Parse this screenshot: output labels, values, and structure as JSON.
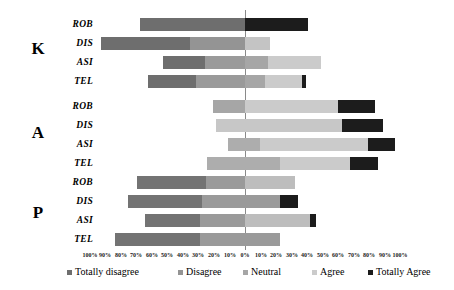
{
  "chart_data": {
    "type": "bar",
    "subtype": "diverging-stacked-likert",
    "title": "",
    "xlabel": "",
    "ylabel": "",
    "grid": false,
    "legend_position": "bottom",
    "axis": {
      "tick_labels": [
        "100%",
        "90%",
        "80%",
        "70%",
        "60%",
        "50%",
        "40%",
        "30%",
        "20%",
        "10%",
        "0%",
        "10%",
        "20%",
        "30%",
        "40%",
        "50%",
        "60%",
        "70%",
        "80%",
        "90%",
        "100%"
      ],
      "tick_values": [
        -100,
        -90,
        -80,
        -70,
        -60,
        -50,
        -40,
        -30,
        -20,
        -10,
        0,
        10,
        20,
        30,
        40,
        50,
        60,
        70,
        80,
        90,
        100
      ],
      "xlim": [
        -100,
        100
      ],
      "zero_at": 0
    },
    "legend": [
      {
        "label": "Totally disagree",
        "color": "#6e6e6e"
      },
      {
        "label": "Disagree",
        "color": "#8f8f8f"
      },
      {
        "label": "Neutral",
        "color": "#a8a8a8"
      },
      {
        "label": "Agree",
        "color": "#cfcfcf"
      },
      {
        "label": "Totally Agree",
        "color": "#1f1f1f"
      }
    ],
    "categories": [
      "Totally disagree",
      "Disagree",
      "Neutral",
      "Agree",
      "Totally Agree"
    ],
    "groups": [
      {
        "name": "K",
        "rows": [
          {
            "label": "ROB",
            "start": -68,
            "values": [
              0,
              0,
              68,
              0,
              41
            ]
          },
          {
            "label": "DIS",
            "start": -92,
            "values": [
              57,
              35,
              16,
              0,
              0
            ]
          },
          {
            "label": "ASI",
            "start": -53,
            "values": [
              27,
              26,
              34,
              0,
              0
            ]
          },
          {
            "label": "TEL",
            "start": -63,
            "values": [
              31,
              32,
              24,
              0,
              4
            ]
          }
        ]
      },
      {
        "name": "A",
        "rows": [
          {
            "label": "ROB",
            "start": -21,
            "values": [
              0,
              0,
              21,
              60,
              24
            ]
          },
          {
            "label": "DIS",
            "start": -19,
            "values": [
              0,
              0,
              0,
              81,
              26
            ]
          },
          {
            "label": "ASI",
            "start": -11,
            "values": [
              0,
              0,
              21,
              70,
              17
            ]
          },
          {
            "label": "TEL",
            "start": -24,
            "values": [
              0,
              0,
              47,
              45,
              18
            ]
          }
        ]
      },
      {
        "name": "P",
        "rows": [
          {
            "label": "ROB",
            "start": -70,
            "values": [
              45,
              25,
              32,
              0,
              0
            ]
          },
          {
            "label": "DIS",
            "start": -76,
            "values": [
              48,
              50,
              0,
              0,
              12
            ]
          },
          {
            "label": "ASI",
            "start": -65,
            "values": [
              35,
              29,
              42,
              0,
              4
            ]
          },
          {
            "label": "TEL",
            "start": -84,
            "values": [
              55,
              51,
              0,
              0,
              0
            ]
          }
        ]
      }
    ]
  },
  "geometry": {
    "zero_x": 245,
    "px_per_pct": 1.55,
    "group_letters": [
      {
        "name": "K",
        "x": 38,
        "y": 40
      },
      {
        "name": "A",
        "x": 38,
        "y": 124
      },
      {
        "name": "P",
        "x": 38,
        "y": 204
      }
    ],
    "rows": [
      {
        "group": "K",
        "label": "ROB",
        "y": 18,
        "segs": [
          {
            "cat": "Totally disagree",
            "x": 140,
            "w": 105,
            "color": "#6e6e6e"
          },
          {
            "cat": "Totally Agree",
            "x": 245,
            "w": 63,
            "color": "#1c1c1c"
          }
        ]
      },
      {
        "group": "K",
        "label": "DIS",
        "y": 37,
        "segs": [
          {
            "cat": "Totally disagree",
            "x": 101,
            "w": 89,
            "color": "#6e6e6e"
          },
          {
            "cat": "Disagree",
            "x": 190,
            "w": 55,
            "color": "#949494"
          },
          {
            "cat": "Neutral",
            "x": 245,
            "w": 25,
            "color": "#c4c4c4"
          }
        ]
      },
      {
        "group": "K",
        "label": "ASI",
        "y": 56,
        "segs": [
          {
            "cat": "Totally disagree",
            "x": 163,
            "w": 42,
            "color": "#6e6e6e"
          },
          {
            "cat": "Disagree",
            "x": 205,
            "w": 40,
            "color": "#9a9a9a"
          },
          {
            "cat": "Neutral",
            "x": 245,
            "w": 23,
            "color": "#a6a6a6"
          },
          {
            "cat": "Agree",
            "x": 268,
            "w": 53,
            "color": "#cbcbcb"
          }
        ]
      },
      {
        "group": "K",
        "label": "TEL",
        "y": 75,
        "segs": [
          {
            "cat": "Totally disagree",
            "x": 148,
            "w": 48,
            "color": "#6e6e6e"
          },
          {
            "cat": "Disagree",
            "x": 196,
            "w": 49,
            "color": "#9a9a9a"
          },
          {
            "cat": "Neutral",
            "x": 245,
            "w": 20,
            "color": "#a6a6a6"
          },
          {
            "cat": "Agree",
            "x": 265,
            "w": 37,
            "color": "#cbcbcb"
          },
          {
            "cat": "Totally Agree",
            "x": 302,
            "w": 4,
            "color": "#1c1c1c"
          }
        ]
      },
      {
        "group": "A",
        "label": "ROB",
        "y": 100,
        "segs": [
          {
            "cat": "Neutral",
            "x": 213,
            "w": 32,
            "color": "#a6a6a6"
          },
          {
            "cat": "Agree",
            "x": 245,
            "w": 93,
            "color": "#cbcbcb"
          },
          {
            "cat": "Totally Agree",
            "x": 338,
            "w": 37,
            "color": "#1c1c1c"
          }
        ]
      },
      {
        "group": "A",
        "label": "DIS",
        "y": 119,
        "segs": [
          {
            "cat": "Agree",
            "x": 216,
            "w": 126,
            "color": "#c7c7c7"
          },
          {
            "cat": "Totally Agree",
            "x": 342,
            "w": 41,
            "color": "#1c1c1c"
          }
        ]
      },
      {
        "group": "A",
        "label": "ASI",
        "y": 138,
        "segs": [
          {
            "cat": "Neutral",
            "x": 228,
            "w": 32,
            "color": "#adadad"
          },
          {
            "cat": "Agree",
            "x": 260,
            "w": 108,
            "color": "#cbcbcb"
          },
          {
            "cat": "Totally Agree",
            "x": 368,
            "w": 27,
            "color": "#1c1c1c"
          }
        ]
      },
      {
        "group": "A",
        "label": "TEL",
        "y": 157,
        "segs": [
          {
            "cat": "Neutral",
            "x": 207,
            "w": 73,
            "color": "#adadad"
          },
          {
            "cat": "Agree",
            "x": 280,
            "w": 70,
            "color": "#cbcbcb"
          },
          {
            "cat": "Totally Agree",
            "x": 350,
            "w": 28,
            "color": "#1c1c1c"
          }
        ]
      },
      {
        "group": "P",
        "label": "ROB",
        "y": 176,
        "segs": [
          {
            "cat": "Totally disagree",
            "x": 137,
            "w": 69,
            "color": "#737373"
          },
          {
            "cat": "Disagree",
            "x": 206,
            "w": 39,
            "color": "#9a9a9a"
          },
          {
            "cat": "Neutral",
            "x": 245,
            "w": 50,
            "color": "#bdbdbd"
          }
        ]
      },
      {
        "group": "P",
        "label": "DIS",
        "y": 195,
        "segs": [
          {
            "cat": "Totally disagree",
            "x": 128,
            "w": 74,
            "color": "#737373"
          },
          {
            "cat": "Disagree",
            "x": 202,
            "w": 78,
            "color": "#9a9a9a"
          },
          {
            "cat": "Totally Agree",
            "x": 280,
            "w": 18,
            "color": "#1c1c1c"
          }
        ]
      },
      {
        "group": "P",
        "label": "ASI",
        "y": 214,
        "segs": [
          {
            "cat": "Totally disagree",
            "x": 145,
            "w": 55,
            "color": "#737373"
          },
          {
            "cat": "Disagree",
            "x": 200,
            "w": 45,
            "color": "#9a9a9a"
          },
          {
            "cat": "Neutral",
            "x": 245,
            "w": 65,
            "color": "#bdbdbd"
          },
          {
            "cat": "Totally Agree",
            "x": 310,
            "w": 6,
            "color": "#1c1c1c"
          }
        ]
      },
      {
        "group": "P",
        "label": "TEL",
        "y": 233,
        "segs": [
          {
            "cat": "Totally disagree",
            "x": 115,
            "w": 85,
            "color": "#737373"
          },
          {
            "cat": "Disagree",
            "x": 200,
            "w": 80,
            "color": "#9a9a9a"
          }
        ]
      }
    ],
    "axis_ticks": [
      {
        "label": "100%",
        "x": 90
      },
      {
        "label": "90%",
        "x": 105
      },
      {
        "label": "80%",
        "x": 121
      },
      {
        "label": "70%",
        "x": 136
      },
      {
        "label": "60%",
        "x": 152
      },
      {
        "label": "50%",
        "x": 167
      },
      {
        "label": "40%",
        "x": 183
      },
      {
        "label": "30%",
        "x": 198
      },
      {
        "label": "20%",
        "x": 214
      },
      {
        "label": "10%",
        "x": 230
      },
      {
        "label": "0%",
        "x": 245
      },
      {
        "label": "10%",
        "x": 261
      },
      {
        "label": "20%",
        "x": 276
      },
      {
        "label": "30%",
        "x": 292
      },
      {
        "label": "40%",
        "x": 307
      },
      {
        "label": "50%",
        "x": 323
      },
      {
        "label": "60%",
        "x": 338
      },
      {
        "label": "70%",
        "x": 354
      },
      {
        "label": "80%",
        "x": 369
      },
      {
        "label": "90%",
        "x": 385
      },
      {
        "label": "100%",
        "x": 400
      }
    ],
    "legend_items": [
      {
        "label": "Totally disagree",
        "color": "#6e6e6e",
        "x": 67
      },
      {
        "label": "Disagree",
        "color": "#949494",
        "x": 178
      },
      {
        "label": "Neutral",
        "color": "#a6a6a6",
        "x": 243
      },
      {
        "label": "Agree",
        "color": "#cbcbcb",
        "x": 312
      },
      {
        "label": "Totally Agree",
        "color": "#1c1c1c",
        "x": 368
      }
    ]
  }
}
